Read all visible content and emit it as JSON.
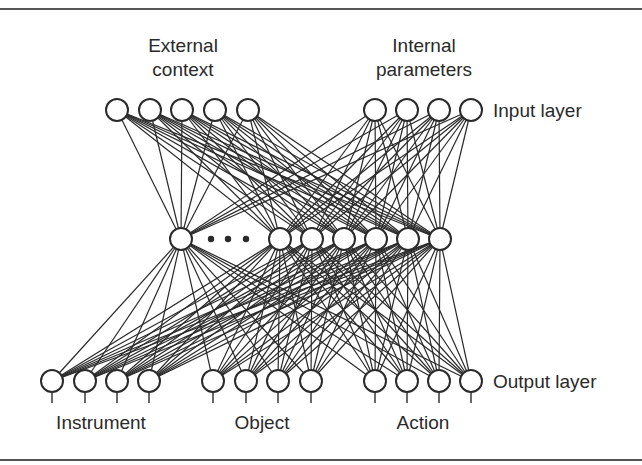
{
  "diagram": {
    "type": "neural-network",
    "colors": {
      "line": "#2a2a2a",
      "node_fill": "#ffffff",
      "node_stroke": "#2a2a2a",
      "rule": "#555555",
      "text": "#2a2a2a"
    },
    "labels": {
      "external_context_1": "External",
      "external_context_2": "context",
      "internal_parameters_1": "Internal",
      "internal_parameters_2": "parameters",
      "input_layer": "Input layer",
      "output_layer": "Output layer",
      "instrument": "Instrument",
      "object": "Object",
      "action": "Action"
    },
    "node_radius": 11,
    "input_layer": {
      "y": 110,
      "groups": [
        {
          "name": "External context",
          "x": [
            117,
            150,
            182,
            215,
            248
          ]
        },
        {
          "name": "Internal parameters",
          "x": [
            375,
            407,
            439,
            471
          ]
        }
      ]
    },
    "hidden_layer": {
      "y": 239,
      "x": [
        181,
        280,
        312,
        344,
        376,
        408,
        440
      ],
      "ellipsis_dots_x": [
        211,
        228,
        246
      ]
    },
    "output_layer": {
      "y": 381,
      "stem_end_y": 403,
      "groups": [
        {
          "name": "Instrument",
          "x": [
            52,
            85,
            117,
            149
          ]
        },
        {
          "name": "Object",
          "x": [
            213,
            246,
            278,
            311
          ]
        },
        {
          "name": "Action",
          "x": [
            375,
            407,
            439,
            471
          ]
        }
      ]
    },
    "connectivity": "fully-connected"
  }
}
